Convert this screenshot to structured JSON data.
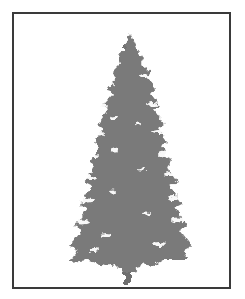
{
  "image": {
    "subject": "conifer-tree-illustration",
    "style": "grayscale silhouette",
    "colors": {
      "background": "#ffffff",
      "frame_border": "#3a3a3a",
      "tree_fill": "#7a7a7a",
      "highlight": "#ffffff"
    }
  }
}
